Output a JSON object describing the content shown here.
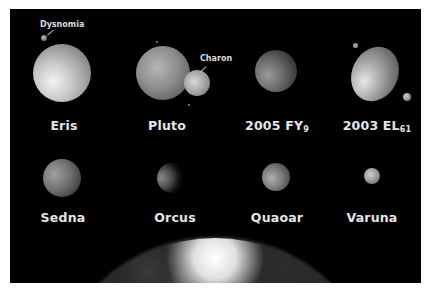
{
  "colors": {
    "background": "#000000",
    "frame": "#ffffff",
    "label": "#e6e6e6"
  },
  "bodies": [
    {
      "name": "Eris",
      "sub": "",
      "moons": [
        {
          "name": "Dysnomia"
        }
      ]
    },
    {
      "name": "Pluto",
      "sub": "",
      "moons": [
        {
          "name": "Charon"
        }
      ]
    },
    {
      "name": "2005 FY",
      "sub": "9",
      "moons": []
    },
    {
      "name": "2003 EL",
      "sub": "61",
      "moons": []
    },
    {
      "name": "Sedna",
      "sub": "",
      "moons": []
    },
    {
      "name": "Orcus",
      "sub": "",
      "moons": []
    },
    {
      "name": "Quaoar",
      "sub": "",
      "moons": []
    },
    {
      "name": "Varuna",
      "sub": "",
      "moons": []
    }
  ],
  "earth": {
    "name": "Earth"
  }
}
